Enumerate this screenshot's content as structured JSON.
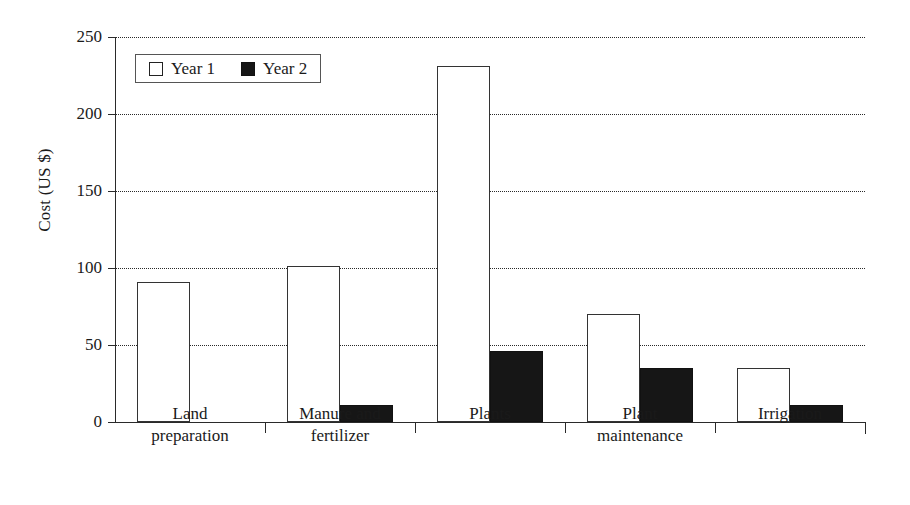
{
  "chart_data": {
    "type": "bar",
    "title": "",
    "xlabel": "",
    "ylabel": "Cost (US $)",
    "ylim": [
      0,
      250
    ],
    "yticks": [
      0,
      50,
      100,
      150,
      200,
      250
    ],
    "grid": true,
    "legend_position": "top-left",
    "categories": [
      "Land preparation",
      "Manure and fertilizer",
      "Plants",
      "Plant maintenance",
      "Irrigation"
    ],
    "category_lines": [
      [
        "Land",
        "preparation"
      ],
      [
        "Manure and",
        "fertilizer"
      ],
      [
        "Plants",
        ""
      ],
      [
        "Plant",
        "maintenance"
      ],
      [
        "Irrigation",
        ""
      ]
    ],
    "series": [
      {
        "name": "Year 1",
        "color": "#ffffff",
        "values": [
          91,
          101,
          231,
          70,
          35
        ]
      },
      {
        "name": "Year 2",
        "color": "#161616",
        "values": [
          0,
          11,
          46,
          35,
          11
        ]
      }
    ]
  },
  "axis": {
    "y_tick_labels": [
      "0",
      "50",
      "100",
      "150",
      "200",
      "250"
    ],
    "y_title": "Cost (US $)"
  },
  "legend": {
    "items": [
      {
        "label": "Year 1",
        "swatch": "open-square"
      },
      {
        "label": "Year 2",
        "swatch": "filled-square"
      }
    ]
  }
}
